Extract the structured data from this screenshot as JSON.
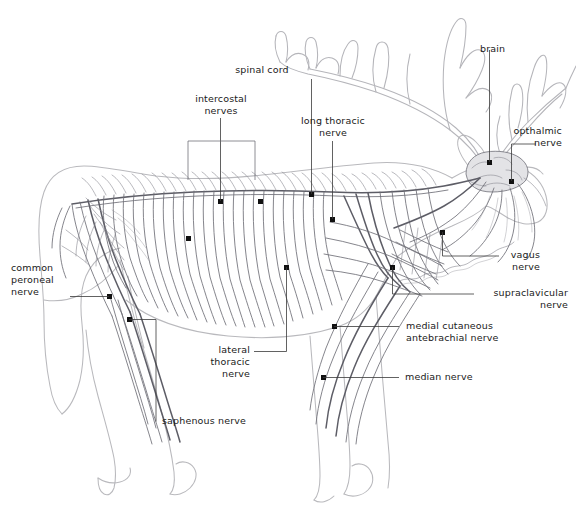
{
  "figure": {
    "view": "lateral left side",
    "background_color": "#ffffff",
    "outline_color": "#b9b9bd",
    "nerve_color": "#6e6e76",
    "marker_color": "#111111",
    "leader_color": "#3a3a3a",
    "text_color": "#1a1a1a"
  },
  "labels": {
    "spinal_cord": "spinal cord",
    "intercostal_nerves": "intercostal\nnerves",
    "long_thoracic_nerve": "long thoracic\nnerve",
    "brain": "brain",
    "opthalmic_nerve": "opthalmic\nnerve",
    "vagus_nerve": "vagus\nnerve",
    "supraclavicular_nerve": "supraclavicular\nnerve",
    "medial_cutaneous_antebrachial_nerve": "medial cutaneous\nantebrachial nerve",
    "median_nerve": "median nerve",
    "lateral_thoracic_nerve": "lateral\nthoracic\nnerve",
    "saphenous_nerve": "saphenous nerve",
    "common_peroneal_nerve": "common\nperoneal\nnerve"
  },
  "structures": [
    {
      "name": "spinal cord",
      "marker": [
        312,
        195
      ]
    },
    {
      "name": "intercostal nerves",
      "marker": [
        221,
        202
      ]
    },
    {
      "name": "long thoracic nerve",
      "marker": [
        333,
        220
      ]
    },
    {
      "name": "brain",
      "marker": [
        490,
        163
      ]
    },
    {
      "name": "opthalmic nerve",
      "marker": [
        512,
        182
      ]
    },
    {
      "name": "vagus nerve",
      "marker": [
        443,
        233
      ]
    },
    {
      "name": "supraclavicular nerve",
      "marker": [
        393,
        268
      ]
    },
    {
      "name": "medial cutaneous antebrachial nerve",
      "marker": [
        335,
        327
      ]
    },
    {
      "name": "median nerve",
      "marker": [
        324,
        378
      ]
    },
    {
      "name": "lateral thoracic nerve",
      "marker": [
        287,
        268
      ]
    },
    {
      "name": "saphenous nerve",
      "marker": [
        130,
        320
      ]
    },
    {
      "name": "common peroneal nerve",
      "marker": [
        110,
        297
      ]
    }
  ]
}
